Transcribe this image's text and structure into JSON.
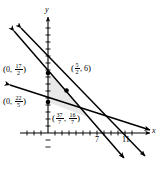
{
  "figure": {
    "axes": {
      "x_axis_label": "x",
      "y_axis_label": "y",
      "x_ticks": [
        {
          "label": "7",
          "value": 7
        },
        {
          "label": "11",
          "value": 11
        }
      ],
      "y_ticks": []
    },
    "point_labels": [
      {
        "name": "y-intercept-upper",
        "text": "(0, 17/2)",
        "open": "(",
        "x_part": "0,",
        "frac_num": "17",
        "frac_den": "2",
        "close": ")"
      },
      {
        "name": "y-intercept-lower",
        "text": "(0, 22/5)",
        "open": "(",
        "x_part": "0,",
        "frac_num": "22",
        "frac_den": "5",
        "close": ")"
      },
      {
        "name": "vertex-upper-right",
        "text": "(5/2, 6)",
        "open": "(",
        "frac_num": "5",
        "frac_den": "2",
        "tail": ", 6",
        "close": ")"
      },
      {
        "name": "vertex-lower-right",
        "text": "(37/7, 16/7)",
        "open": "(",
        "frac1_num": "37",
        "frac1_den": "7",
        "mid": ",",
        "frac2_num": "16",
        "frac2_den": "7",
        "close": ")"
      }
    ],
    "vertices": [
      {
        "label": "(0, 17/2)",
        "x": 0,
        "y": 8.5
      },
      {
        "label": "(5/2, 6)",
        "x": 2.5,
        "y": 6
      },
      {
        "label": "(37/7, 16/7)",
        "x": 5.2857,
        "y": 2.2857
      },
      {
        "label": "(0, 22/5)",
        "x": 0,
        "y": 4.4
      }
    ],
    "colors": {
      "line": "#000000",
      "axis": "#000000",
      "shaded_region": "#e6e6e6",
      "background": "#ffffff"
    }
  }
}
